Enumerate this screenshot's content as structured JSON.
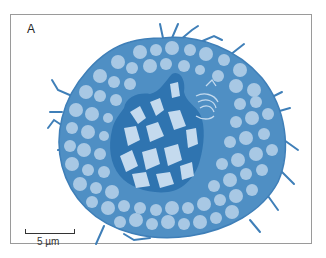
{
  "figure": {
    "panel_label": "A",
    "scale_bar_label": "5 µm",
    "colors": {
      "cytoplasm": "#4f8fc4",
      "cytoplasm_edge": "#3f7fb8",
      "vesicle": "#a8c8e4",
      "nucleus_dark": "#2f74b0",
      "chromatin_light": "#c4daee",
      "frame": "#9a9a9a"
    }
  }
}
